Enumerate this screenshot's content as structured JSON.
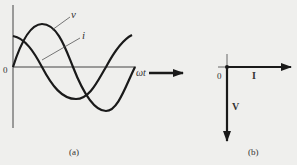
{
  "colors": {
    "background": "#efefed",
    "stroke": "#1a1a1a",
    "text": "#333333"
  },
  "panel_a": {
    "caption": "(a)",
    "origin_label": "0",
    "x_axis_label": "ωt",
    "curve_v_label": "v",
    "curve_i_label": "i"
  },
  "panel_b": {
    "caption": "(b)",
    "origin_label": "0",
    "phasor_i_label": "I",
    "phasor_v_label": "V"
  }
}
